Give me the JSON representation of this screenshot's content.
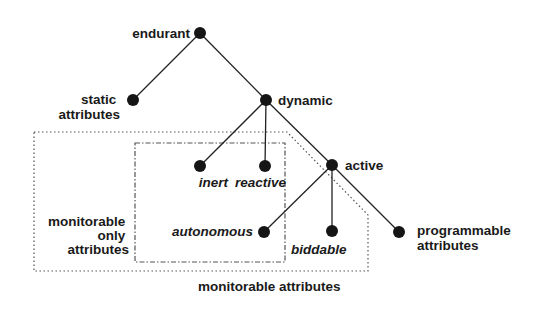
{
  "diagram": {
    "type": "tree",
    "nodes": {
      "endurant": {
        "label": "endurant",
        "x": 200,
        "y": 33
      },
      "static": {
        "label_line1": "static",
        "label_line2": "attributes",
        "x": 133,
        "y": 100
      },
      "dynamic": {
        "label": "dynamic",
        "x": 266,
        "y": 100
      },
      "inert": {
        "label": "inert",
        "x": 200,
        "y": 166
      },
      "reactive": {
        "label": "reactive",
        "x": 265,
        "y": 166
      },
      "active": {
        "label": "active",
        "x": 332,
        "y": 165
      },
      "autonomous": {
        "label": "autonomous",
        "x": 264,
        "y": 232
      },
      "biddable": {
        "label": "biddable",
        "x": 332,
        "y": 231
      },
      "programmable": {
        "label_line1": "programmable",
        "label_line2": "attributes",
        "x": 399,
        "y": 232
      }
    },
    "edges": [
      [
        "endurant",
        "static"
      ],
      [
        "endurant",
        "dynamic"
      ],
      [
        "dynamic",
        "inert"
      ],
      [
        "dynamic",
        "reactive"
      ],
      [
        "dynamic",
        "active"
      ],
      [
        "active",
        "autonomous"
      ],
      [
        "active",
        "biddable"
      ],
      [
        "active",
        "programmable"
      ]
    ],
    "groups": {
      "monitorable_only": {
        "label_line1": "monitorable",
        "label_line2": "only",
        "label_line3": "attributes",
        "border": "dash-dot",
        "contains": [
          "inert",
          "reactive",
          "autonomous"
        ]
      },
      "monitorable": {
        "label": "monitorable attributes",
        "border": "dotted",
        "contains": [
          "inert",
          "reactive",
          "autonomous",
          "biddable"
        ]
      }
    },
    "colors": {
      "node": "#151515",
      "edge": "#222222",
      "text": "#1a1a1a",
      "background": "#ffffff"
    }
  }
}
